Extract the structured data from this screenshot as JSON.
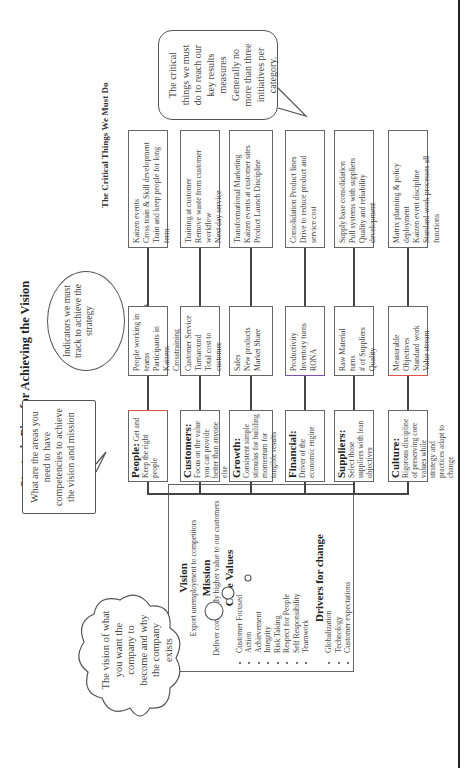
{
  "title": {
    "pre": "Strategic P",
    "hl": "la",
    "post": "n for Achieving the Vision"
  },
  "headers": {
    "capabilities": "Key Capabilities",
    "goals": "Goals & Measures",
    "critical": "The Critical Things We Must Do"
  },
  "bubbles": {
    "capabilities": "What are the areas you need to have competencies to achieve the vision and mission",
    "indicators": "Indicators we must track to achieve the strategy",
    "critical_lines": [
      "The critical",
      "things we must",
      "do to reach our",
      "key results",
      "measures",
      "Generally no",
      "more than three",
      "initiatives per",
      "category."
    ],
    "vision_cloud": "The vision of what you want the company to become and why the company exists"
  },
  "rows": [
    {
      "capability_label": "People:",
      "capability_text": "Get and Keep the right people",
      "goals": [
        "People working in teams",
        "Participants in Kaizens",
        "Crosstraining Turnover"
      ],
      "critical": [
        "Kaizen events",
        "Cross train & Skill development",
        "Train and keep people for long term"
      ]
    },
    {
      "capability_label": "Customers:",
      "capability_text": "Focus on the value you can provide better than anyone else",
      "goals": [
        "Customer Service",
        "Turnaround",
        "Total cost to customer"
      ],
      "critical": [
        "Training at customer",
        "Remove waste from customer workflow",
        "Next day service"
      ]
    },
    {
      "capability_label": "Growth:",
      "capability_text": "Consistent simple stimulus for building momentum for tangible results",
      "goals": [
        "Sales",
        "New products",
        "Market Share"
      ],
      "critical": [
        "Transformational Marketing",
        "Kaizen events at customer sites",
        "Product Launch Discipline"
      ]
    },
    {
      "capability_label": "Financial:",
      "capability_text": "Driver of the economic engine",
      "goals": [
        "Productivity",
        "Inventory turns",
        "RONA"
      ],
      "critical": [
        "Consolidation Product lines",
        "Drive to reduce product and service cost"
      ]
    },
    {
      "capability_label": "Suppliers:",
      "capability_text": "Select those suppliers with lean objectives",
      "goals": [
        "Raw Material turns",
        "# of Suppliers",
        "Quality"
      ],
      "critical": [
        "Supply base consolidation",
        "Pull systems with suppliers",
        "Quality and reliability development"
      ]
    },
    {
      "capability_label": "Culture:",
      "capability_text": "Rigorous discipline of preserving core values while strategy and practices adapt to change",
      "goals": [
        "Measurable Objectives",
        "Standard work",
        "Value stream"
      ],
      "critical": [
        "Matrix planning & policy deployment",
        "Kaizen event discipline",
        "Standard work processes all functions"
      ]
    }
  ],
  "vision_box": {
    "vision_heading": "Vision",
    "vision_text": "Export unemployment to competitors",
    "mission_heading": "Mission",
    "mission_text": "Deliver continually higher value to our customers",
    "values_heading": "Core Values",
    "values": [
      "Customer Focused",
      "Action",
      "Achievement",
      "Integrity",
      "Risk Taking",
      "Respect for People",
      "Self Responsibility",
      "Teamwork"
    ],
    "drivers_heading": "Drivers for change",
    "drivers": [
      "Globalization",
      "Technology",
      "Customer expectations"
    ]
  }
}
